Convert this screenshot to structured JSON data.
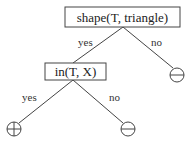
{
  "diagram": {
    "type": "decision-tree",
    "colors": {
      "stroke": "#444444",
      "text": "#222222",
      "background": "#ffffff"
    },
    "nodes": {
      "root": {
        "label": "shape(T, triangle)"
      },
      "inner": {
        "label": "in(T, X)"
      },
      "leaf_root_no": {
        "symbol": "minus",
        "icon": "circled-minus-icon"
      },
      "leaf_inner_yes": {
        "symbol": "plus",
        "icon": "circled-plus-icon"
      },
      "leaf_inner_no": {
        "symbol": "minus",
        "icon": "circled-minus-icon"
      }
    },
    "edges": {
      "root_yes": {
        "label": "yes"
      },
      "root_no": {
        "label": "no"
      },
      "inner_yes": {
        "label": "yes"
      },
      "inner_no": {
        "label": "no"
      }
    }
  }
}
